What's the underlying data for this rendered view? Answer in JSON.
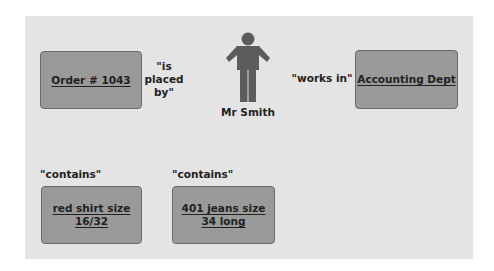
{
  "diagram": {
    "entities": {
      "order": "Order # 1043",
      "department": "Accounting Dept",
      "item1_line1": "red shirt size",
      "item1_line2": "16/32",
      "item2_line1": "401 jeans size",
      "item2_line2": "34 long"
    },
    "person": {
      "label": "Mr Smith",
      "icon": "person-icon"
    },
    "relationships": {
      "placed_by": "\"is\nplaced\nby\"",
      "works_in": "\"works in\"",
      "contains_1": "\"contains\"",
      "contains_2": "\"contains\""
    },
    "colors": {
      "panel": "#e4e4e4",
      "entity_fill": "#9a9a9a",
      "entity_border": "#6a6a6a",
      "person": "#5c5c5c"
    }
  }
}
